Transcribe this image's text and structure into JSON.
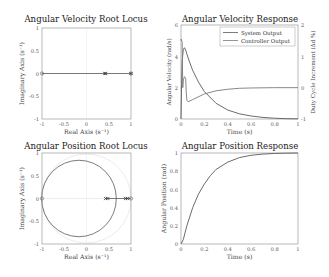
{
  "chart_data": [
    {
      "type": "scatter",
      "title": "Angular Velocity Root Locus",
      "xlabel": "Real Axis (s^-1)",
      "ylabel": "Imaginary Axis (s^-1)",
      "xlim": [
        -1,
        1
      ],
      "ylim": [
        -1,
        1
      ],
      "xticks": [
        "-1",
        "-0.5",
        "0",
        "0.5",
        "1"
      ],
      "yticks": [
        "1",
        "0.5",
        "0",
        "-0.5",
        "-1"
      ],
      "grid": false,
      "unit_circle": false,
      "locus_segments": [
        {
          "x": [
            -1,
            1
          ],
          "y": [
            0,
            0
          ]
        }
      ],
      "poles": [
        {
          "x": 0.41,
          "y": 0
        }
      ],
      "zeros": [
        {
          "x": -1,
          "y": 0
        },
        {
          "x": 1,
          "y": 0
        }
      ],
      "ci_markers": [
        {
          "x": 0.43,
          "y": 0
        },
        {
          "x": 1,
          "y": 0
        }
      ]
    },
    {
      "type": "line",
      "title": "Angular Velocity Response",
      "xlabel": "Time (s)",
      "ylabel": "Angular Velocity (rad/s)",
      "ylabel_right": "Duty Cycle Increment (Δd %)",
      "xlim": [
        0,
        1
      ],
      "ylim": [
        0,
        6
      ],
      "ylim_right": [
        -1,
        2
      ],
      "xticks": [
        "0",
        "0.2",
        "0.4",
        "0.6",
        "0.8",
        "1"
      ],
      "yticks": [
        "6",
        "4",
        "2",
        "0"
      ],
      "yticks_right": [
        "2",
        "1",
        "0",
        "-1"
      ],
      "legend_position": "upper right",
      "series": [
        {
          "name": "System Output",
          "axis": "left",
          "x": [
            0,
            0.005,
            0.01,
            0.02,
            0.03,
            0.04,
            0.05,
            0.07,
            0.1,
            0.15,
            0.2,
            0.3,
            0.4,
            0.5,
            0.6,
            0.7,
            0.8,
            0.9,
            1.0
          ],
          "values": [
            0,
            2.2,
            3.7,
            4.45,
            4.55,
            4.4,
            4.15,
            3.7,
            3.1,
            2.35,
            1.75,
            1.0,
            0.57,
            0.33,
            0.19,
            0.1,
            0.05,
            0.02,
            0.01
          ]
        },
        {
          "name": "Controller Output",
          "axis": "right",
          "x": [
            0,
            0.001,
            0.01,
            0.015,
            0.02,
            0.03,
            0.04,
            0.045,
            0.05,
            0.06,
            0.1,
            0.2,
            0.3,
            0.4,
            0.5,
            0.6,
            0.8,
            1.0
          ],
          "values": [
            1.5,
            1.55,
            1.45,
            0.0,
            0.25,
            0.35,
            0.3,
            -0.15,
            -0.4,
            -0.45,
            -0.38,
            -0.2,
            -0.1,
            -0.05,
            -0.02,
            -0.01,
            0.0,
            0.0
          ]
        }
      ]
    },
    {
      "type": "scatter",
      "title": "Angular Position Root Locus",
      "xlabel": "Real Axis (s^-1)",
      "ylabel": "Imaginary Axis (s^-1)",
      "xlim": [
        -1,
        1
      ],
      "ylim": [
        -1,
        1
      ],
      "xticks": [
        "-1",
        "-0.5",
        "0",
        "0.5",
        "1"
      ],
      "yticks": [
        "1",
        "0.5",
        "0",
        "-0.5",
        "-1"
      ],
      "grid": false,
      "unit_circle": true,
      "locus_circle": {
        "cx": -0.17,
        "cy": 0,
        "r": 0.84
      },
      "locus_segments": [
        {
          "x": [
            0.43,
            1
          ],
          "y": [
            0,
            0
          ]
        }
      ],
      "poles": [
        {
          "x": 0.43,
          "y": 0
        },
        {
          "x": 0.48,
          "y": 0
        },
        {
          "x": 0.88,
          "y": 0
        },
        {
          "x": 0.92,
          "y": 0
        }
      ],
      "zeros": [
        {
          "x": -1,
          "y": 0
        },
        {
          "x": 1,
          "y": 0
        }
      ]
    },
    {
      "type": "line",
      "title": "Angular Position Response",
      "xlabel": "Time (s)",
      "ylabel": "Angular Position (rad)",
      "xlim": [
        0,
        1
      ],
      "ylim": [
        0,
        1
      ],
      "xticks": [
        "0",
        "0.2",
        "0.4",
        "0.6",
        "0.8",
        "1"
      ],
      "yticks": [
        "1",
        "0.8",
        "0.6",
        "0.4",
        "0.2",
        "0"
      ],
      "series": [
        {
          "name": "Angular Position",
          "x": [
            0,
            0.02,
            0.05,
            0.1,
            0.15,
            0.2,
            0.25,
            0.3,
            0.4,
            0.5,
            0.6,
            0.7,
            0.8,
            0.9,
            1.0
          ],
          "values": [
            0,
            0.05,
            0.2,
            0.4,
            0.55,
            0.66,
            0.75,
            0.82,
            0.9,
            0.95,
            0.975,
            0.988,
            0.995,
            0.998,
            1.0
          ]
        }
      ]
    }
  ],
  "colors": {
    "series_1": "#5a5a5a",
    "series_2": "#7a7a7a",
    "axis": "#9a9a9a",
    "unit_circle": "#e6e6e6"
  },
  "panels": {
    "p1": {
      "title": "Angular Velocity Root Locus",
      "xlabel": "Real Axis (s⁻¹)",
      "ylabel": "Imaginary Axis (s⁻¹)"
    },
    "p2": {
      "title": "Angular Velocity Response",
      "xlabel": "Time (s)",
      "ylabel": "Angular Velocity (rad/s)",
      "ylabel_right": "Duty Cycle Increment (Δd %)",
      "legend_1": "System Output",
      "legend_2": "Controller Output"
    },
    "p3": {
      "title": "Angular Position Root Locus",
      "xlabel": "Real Axis (s⁻¹)",
      "ylabel": "Imaginary Axis (s⁻¹)"
    },
    "p4": {
      "title": "Angular Position Response",
      "xlabel": "Time (s)",
      "ylabel": "Angular Position (rad)"
    }
  }
}
